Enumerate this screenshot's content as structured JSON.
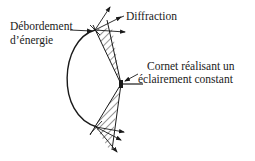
{
  "diagram": {
    "type": "reflector-antenna-illumination",
    "labels": {
      "spillover_line1": "Débordement",
      "spillover_line2": "d’énergie",
      "diffraction": "Diffraction",
      "horn_line1": "Cornet réalisant un",
      "horn_line2": "éclairement constant"
    },
    "elements": [
      "parabolic-reflector",
      "feed-horn",
      "upper-beam-cone",
      "lower-beam-cone",
      "diffraction-arrows",
      "spillover-arrow"
    ],
    "colors": {
      "ink": "#1a1a1a",
      "background": "#ffffff"
    }
  }
}
